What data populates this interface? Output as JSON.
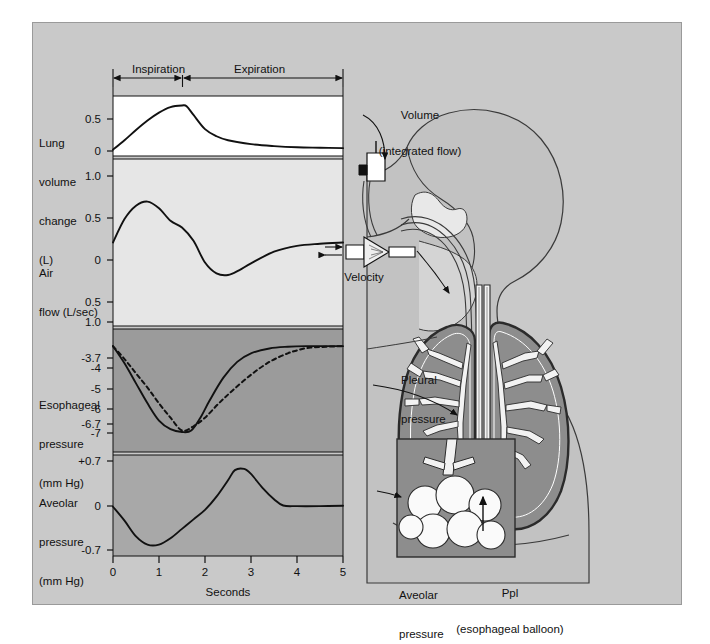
{
  "figure": {
    "background_color": "#c9c9c9",
    "panel_light_color": "#ffffff",
    "panel_mid_color": "#e2e2e2",
    "panel_dark_color": "#9b9b9b",
    "panel_gray_color": "#a8a8a8",
    "line_color": "#111111"
  },
  "phases": [
    {
      "name": "inspiration-span",
      "label": "Inspiration",
      "start_s": 0,
      "end_s": 1.5
    },
    {
      "name": "expiration-span",
      "label": "Expiration",
      "start_s": 1.5,
      "end_s": 5
    }
  ],
  "axis": {
    "x_label": "Seconds",
    "x_ticks": [
      "0",
      "1",
      "2",
      "3",
      "4",
      "5"
    ],
    "x_min": 0,
    "x_max": 5
  },
  "panels": [
    {
      "name": "lung-volume-panel",
      "label_lines": [
        "Lung",
        "volume",
        "change",
        "(L)"
      ],
      "y_ticks": [
        "0.5",
        "0"
      ],
      "y_tick_values": [
        0.5,
        0
      ],
      "y_min": -0.08,
      "y_max": 0.68,
      "units": "L"
    },
    {
      "name": "air-flow-panel",
      "label_lines": [
        "Air",
        "flow (L/sec)"
      ],
      "y_ticks": [
        "1.0",
        "0.5",
        "0",
        "0.5",
        "1.0"
      ],
      "y_tick_values": [
        1.0,
        0.5,
        0,
        -0.5,
        -1.0
      ],
      "y_min": -1.0,
      "y_max": 1.0,
      "units": "L/sec"
    },
    {
      "name": "esophageal-pressure-panel",
      "label_lines": [
        "Esophageal",
        "pressure",
        "(mm Hg)"
      ],
      "y_ticks": [
        "-3.7",
        "-4",
        "-5",
        "-6",
        "-6.7",
        "-7"
      ],
      "y_tick_values": [
        -3.7,
        -4,
        -5,
        -6,
        -6.7,
        -7
      ],
      "y_min": -7.4,
      "y_max": -3.1,
      "units": "mm Hg"
    },
    {
      "name": "alveolar-pressure-panel",
      "label_lines": [
        "Aveolar",
        "pressure",
        "(mm Hg)"
      ],
      "y_ticks": [
        "+0.7",
        "0",
        "-0.7"
      ],
      "y_tick_values": [
        0.7,
        0,
        -0.7
      ],
      "y_min": -0.78,
      "y_max": 0.82,
      "units": "mm Hg"
    }
  ],
  "anatomy_labels": [
    {
      "name": "volume-label",
      "lines": [
        "Volume",
        "(integrated flow)"
      ]
    },
    {
      "name": "velocity-label",
      "lines": [
        "Velocity"
      ]
    },
    {
      "name": "pleural-pressure-label",
      "lines": [
        "Pleural",
        "pressure"
      ]
    },
    {
      "name": "alveolar-pressure-label",
      "lines": [
        "Aveolar",
        "pressure"
      ]
    },
    {
      "name": "ppl-label",
      "lines": [
        "Ppl",
        "(esophageal balloon)"
      ]
    }
  ],
  "chart_data": {
    "type": "line",
    "title": "",
    "xlabel": "Seconds",
    "xlim": [
      0,
      5
    ],
    "grid": false,
    "legend": "none",
    "subplots": [
      {
        "name": "lung-volume-change",
        "ylabel": "Lung volume change (L)",
        "ylim": [
          -0.08,
          0.68
        ],
        "yticks": [
          0.5,
          0
        ],
        "series": [
          {
            "name": "lung-volume",
            "style": "solid",
            "x": [
              0,
              0.25,
              0.5,
              0.75,
              1.0,
              1.25,
              1.5,
              1.6,
              1.75,
              2.0,
              2.25,
              2.5,
              3.0,
              3.5,
              4.0,
              4.5,
              5.0
            ],
            "y": [
              0.0,
              0.12,
              0.25,
              0.37,
              0.47,
              0.54,
              0.56,
              0.55,
              0.44,
              0.26,
              0.17,
              0.12,
              0.07,
              0.045,
              0.03,
              0.025,
              0.02
            ]
          }
        ]
      },
      {
        "name": "air-flow",
        "ylabel": "Air flow (L/sec)",
        "ylim": [
          -1.0,
          1.0
        ],
        "yticks": [
          1.0,
          0.5,
          0,
          -0.5,
          -1.0
        ],
        "series": [
          {
            "name": "air-flow",
            "style": "solid",
            "x": [
              0,
              0.25,
              0.5,
              0.75,
              1.0,
              1.25,
              1.5,
              1.75,
              2.0,
              2.25,
              2.5,
              2.75,
              3.0,
              3.5,
              4.0,
              4.5,
              5.0
            ],
            "y": [
              0.0,
              0.28,
              0.44,
              0.49,
              0.41,
              0.26,
              0.18,
              0.02,
              -0.24,
              -0.37,
              -0.39,
              -0.33,
              -0.25,
              -0.11,
              -0.04,
              -0.015,
              0.0
            ]
          }
        ]
      },
      {
        "name": "esophageal-pressure",
        "ylabel": "Esophageal pressure (mm Hg)",
        "ylim": [
          -7.4,
          -3.1
        ],
        "yticks": [
          -3.7,
          -4,
          -5,
          -6,
          -6.7,
          -7
        ],
        "series": [
          {
            "name": "esophageal-pressure-actual",
            "style": "solid",
            "x": [
              0,
              0.25,
              0.5,
              0.75,
              1.0,
              1.25,
              1.5,
              1.7,
              1.9,
              2.1,
              2.4,
              2.7,
              3.0,
              3.4,
              3.8,
              4.2,
              5.0
            ],
            "y": [
              -3.7,
              -4.3,
              -5.0,
              -5.7,
              -6.3,
              -6.6,
              -6.7,
              -6.65,
              -6.2,
              -5.6,
              -4.8,
              -4.25,
              -3.95,
              -3.78,
              -3.72,
              -3.7,
              -3.7
            ]
          },
          {
            "name": "esophageal-pressure-elastic",
            "style": "dashed",
            "x": [
              0,
              0.25,
              0.5,
              0.75,
              1.0,
              1.25,
              1.5,
              1.75,
              2.0,
              2.3,
              2.6,
              3.0,
              3.4,
              3.8,
              4.0,
              4.3,
              5.0
            ],
            "y": [
              -3.7,
              -4.15,
              -4.65,
              -5.15,
              -5.7,
              -6.2,
              -6.65,
              -6.5,
              -6.2,
              -5.7,
              -5.25,
              -4.7,
              -4.25,
              -3.95,
              -3.85,
              -3.75,
              -3.7
            ]
          }
        ]
      },
      {
        "name": "alveolar-pressure",
        "ylabel": "Aveolar pressure (mm Hg)",
        "ylim": [
          -0.78,
          0.82
        ],
        "yticks": [
          0.7,
          0,
          -0.7
        ],
        "series": [
          {
            "name": "alveolar-pressure",
            "style": "solid",
            "x": [
              0,
              0.25,
              0.5,
              0.75,
              1.0,
              1.25,
              1.5,
              1.75,
              2.0,
              2.25,
              2.5,
              2.65,
              2.85,
              3.0,
              3.25,
              3.5,
              3.7,
              4.0,
              4.5,
              5.0
            ],
            "y": [
              0.0,
              -0.22,
              -0.47,
              -0.6,
              -0.6,
              -0.5,
              -0.35,
              -0.2,
              -0.05,
              0.16,
              0.42,
              0.58,
              0.6,
              0.52,
              0.3,
              0.12,
              0.02,
              0.01,
              0.01,
              0.015
            ]
          }
        ]
      }
    ]
  }
}
